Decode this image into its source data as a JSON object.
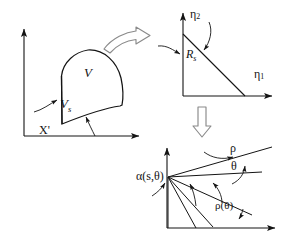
{
  "figure": {
    "title_semantic": "domain-mapping-diagram",
    "width": 286,
    "height": 244,
    "background_color": "#ffffff",
    "stroke_color": "#141414",
    "arrow_stroke_color": "#8a8a8a"
  },
  "panels": {
    "physical_domain": {
      "name": "physical-domain-panel",
      "labels": {
        "volume": "V",
        "surface_base": "V",
        "surface_sub": "s",
        "point": "X'"
      }
    },
    "mapped_domain": {
      "name": "mapped-domain-panel",
      "labels": {
        "axis_y_base": "η",
        "axis_y_sub": "2",
        "axis_x_base": "η",
        "axis_x_sub": "1",
        "region_base": "R",
        "region_sub": "s"
      }
    },
    "polar_domain": {
      "name": "polar-domain-panel",
      "labels": {
        "alpha": "α(s,θ)",
        "rho": "ρ",
        "theta": "θ",
        "rho_of_theta": "ρ(θ)"
      }
    }
  },
  "connectors": {
    "curved_arrow": "curved-block-arrow-right",
    "down_arrow": "block-arrow-down"
  }
}
